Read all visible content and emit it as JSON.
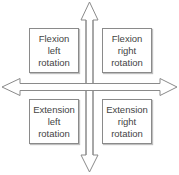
{
  "diagram": {
    "type": "quadrant-cross",
    "axes": {
      "vertical": {
        "direction": "bidirectional",
        "icon": "double-headed-vertical-arrow"
      },
      "horizontal": {
        "direction": "bidirectional",
        "icon": "double-headed-horizontal-arrow"
      }
    },
    "quadrants": [
      {
        "position": "top-left",
        "line1": "Flexion",
        "line2": "left",
        "line3": "rotation"
      },
      {
        "position": "top-right",
        "line1": "Flexion",
        "line2": "right",
        "line3": "rotation"
      },
      {
        "position": "bottom-left",
        "line1": "Extension",
        "line2": "left",
        "line3": "rotation"
      },
      {
        "position": "bottom-right",
        "line1": "Extension",
        "line2": "right",
        "line3": "rotation"
      }
    ],
    "colors": {
      "stroke": "#8a8a8a",
      "text": "#444444",
      "background": "#ffffff"
    }
  }
}
